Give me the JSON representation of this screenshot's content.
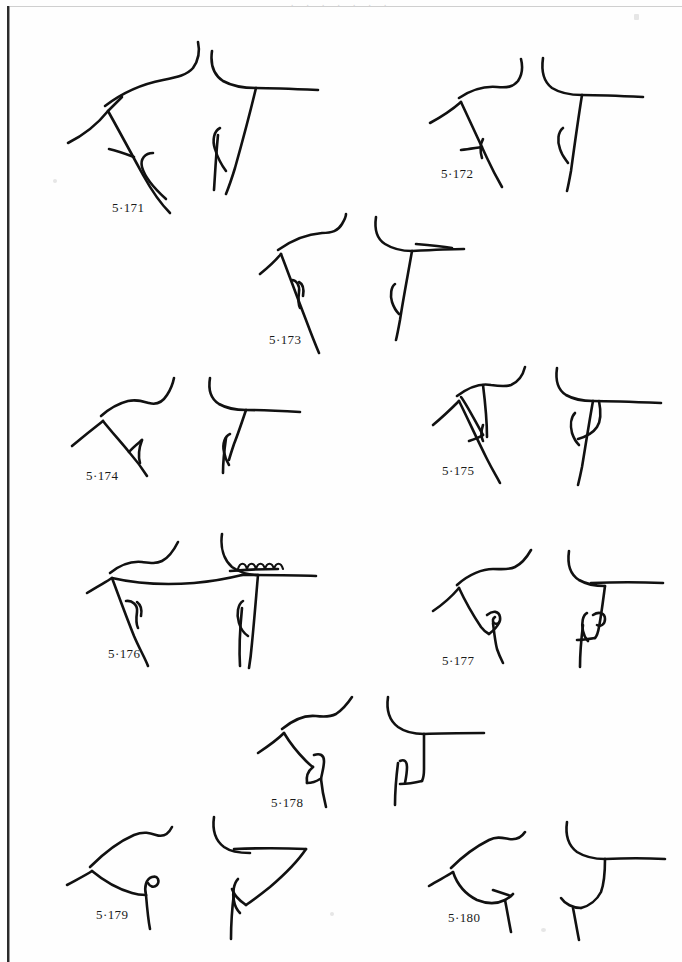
{
  "plate": {
    "kind": "line-drawing-plate",
    "background_color": "#fefefe",
    "ink_color": "#111111",
    "border_color": "#2b2b2b",
    "width": 682,
    "height": 962,
    "header_ghost": ". . . . . . .",
    "figure_count": 10
  },
  "figures": [
    {
      "id": "fig-5-171",
      "label": "5·171",
      "label_x": 112,
      "label_y": 200,
      "views": [
        "perspective",
        "section"
      ],
      "feature": "plain flaring rim with long tapering strap handle"
    },
    {
      "id": "fig-5-172",
      "label": "5·172",
      "label_x": 441,
      "label_y": 166,
      "views": [
        "perspective",
        "section"
      ],
      "feature": "plain flaring rim with short lug"
    },
    {
      "id": "fig-5-173",
      "label": "5·173",
      "label_x": 269,
      "label_y": 342,
      "views": [
        "perspective",
        "section"
      ],
      "feature": "everted rim with small looped handle"
    },
    {
      "id": "fig-5-174",
      "label": "5·174",
      "label_x": 88,
      "label_y": 476,
      "views": [
        "perspective",
        "section"
      ],
      "feature": "angular shoulder with narrow vertical handle"
    },
    {
      "id": "fig-5-175",
      "label": "5·175",
      "label_x": 442,
      "label_y": 476,
      "views": [
        "perspective",
        "section"
      ],
      "feature": "rim with broad triangular handle attachment"
    },
    {
      "id": "fig-5-176",
      "label": "5·176",
      "label_x": 108,
      "label_y": 662,
      "views": [
        "perspective",
        "section"
      ],
      "feature": "wide bowl with notched / scalloped rim decoration"
    },
    {
      "id": "fig-5-177",
      "label": "5·177",
      "label_x": 442,
      "label_y": 653,
      "views": [
        "perspective",
        "section"
      ],
      "feature": "rim with curled hooked handle terminal"
    },
    {
      "id": "fig-5-178",
      "label": "5·178",
      "label_x": 271,
      "label_y": 795,
      "views": [
        "perspective",
        "section"
      ],
      "feature": "rim with small squared loop handle"
    },
    {
      "id": "fig-5-179",
      "label": "5·179",
      "label_x": 96,
      "label_y": 915,
      "views": [
        "perspective",
        "section"
      ],
      "feature": "rounded shoulder with upturned hooked handle"
    },
    {
      "id": "fig-5-180",
      "label": "5·180",
      "label_x": 448,
      "label_y": 915,
      "views": [
        "perspective",
        "section"
      ],
      "feature": "rounded shoulder with short downturned handle"
    }
  ]
}
